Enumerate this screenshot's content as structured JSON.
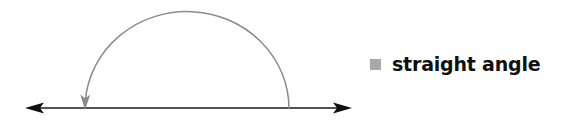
{
  "figure": {
    "width": 568,
    "height": 125,
    "background_color": "#ffffff"
  },
  "legend": {
    "swatch_color": "#a8a8a8",
    "label": "straight angle"
  },
  "diagram": {
    "baseline": {
      "color": "#1a1a1a",
      "y": 108,
      "x_start": 25,
      "x_end": 352,
      "left_arrowhead": "arrow-left",
      "right_arrowhead": "arrow-right",
      "stroke_width": 1.6
    },
    "arc": {
      "color": "#8a8a8a",
      "start_x": 289,
      "start_y": 108,
      "apex_x": 187,
      "apex_y": 11,
      "end_x": 85,
      "end_y": 108,
      "arrowhead": "arrow-down",
      "stroke_width": 1.4,
      "angle_degrees": 180
    }
  }
}
